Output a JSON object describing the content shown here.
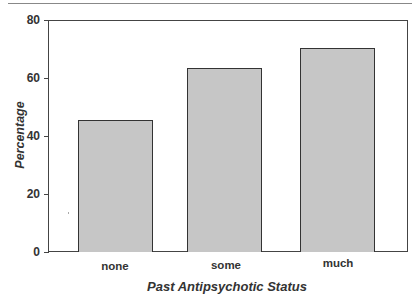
{
  "chart_data": {
    "type": "bar",
    "title": "",
    "xlabel": "Past Antipsychotic Status",
    "ylabel": "Percentage",
    "categories": [
      "none",
      "some",
      "much"
    ],
    "values": [
      45.5,
      63.5,
      70.5
    ],
    "ylim": [
      0,
      80
    ],
    "yticks": [
      "0",
      "20",
      "40",
      "60",
      "80"
    ],
    "grid": false,
    "legend": null,
    "bar_color": "#c6c6c6"
  }
}
